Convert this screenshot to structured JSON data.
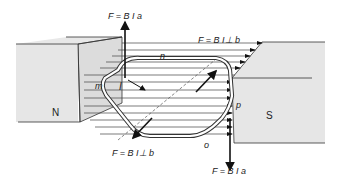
{
  "figure": {
    "magnets": {
      "north": {
        "label": "N"
      },
      "south": {
        "label": "S"
      }
    },
    "loop_corners": {
      "m": "m",
      "n": "n",
      "o": "o",
      "p": "p"
    },
    "current_label": "I",
    "forces": {
      "top": "F = B I a",
      "bottom": "F = B I a",
      "upper_right": "F = B I⊥ b",
      "lower_left": "F = B I⊥ b"
    },
    "colors": {
      "magnet_face": "#e6e6e6",
      "magnet_side": "#d9d9d9",
      "lines": "#333333",
      "background": "#ffffff"
    }
  }
}
